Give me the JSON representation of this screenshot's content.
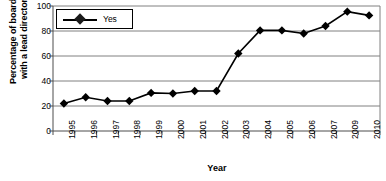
{
  "chart_data": {
    "type": "line",
    "title": "",
    "xlabel": "Year",
    "ylabel": "Percentage of boards\nwith a lead director",
    "categories": [
      "1995",
      "1996",
      "1997",
      "1998",
      "1999",
      "2000",
      "2001",
      "2002",
      "2003",
      "2004",
      "2005",
      "2006",
      "2007",
      "2009",
      "2010"
    ],
    "series": [
      {
        "name": "Yes",
        "values": [
          22,
          27,
          24,
          24,
          30.5,
          30,
          32,
          32,
          62,
          80.5,
          80.5,
          78,
          84,
          95.5,
          92.5
        ],
        "marker": "diamond",
        "color": "#000000"
      }
    ],
    "ylim": [
      0,
      100
    ],
    "yticks": [
      0,
      20,
      40,
      60,
      80,
      100
    ],
    "ytick_labels": [
      "0",
      "20",
      "40",
      "60",
      "80",
      "100"
    ],
    "grid": "horizontal",
    "legend_position": "top-left",
    "legend_entries": [
      "Yes"
    ]
  },
  "axes": {
    "y_title": "Percentage of boards\nwith a lead director",
    "x_title": "Year"
  },
  "legend": {
    "series_label": "Yes"
  }
}
